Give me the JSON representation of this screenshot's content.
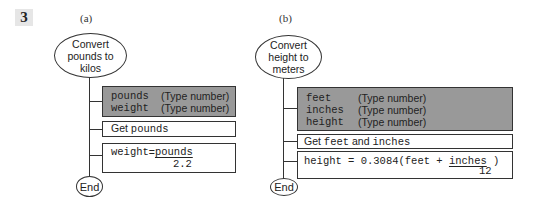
{
  "exercise_number": "3",
  "panel_a": {
    "label": "(a)",
    "start": {
      "line1": "Convert",
      "line2": "pounds to",
      "line3": "kilos"
    },
    "declare": [
      {
        "name": "pounds",
        "type": "(Type number)"
      },
      {
        "name": "weight",
        "type": "(Type number)"
      }
    ],
    "get": {
      "prefix": "Get ",
      "var": "pounds"
    },
    "assign": {
      "lhs": "weight",
      "eq": " = ",
      "numerator": "pounds",
      "denominator": "2.2"
    },
    "end": "End"
  },
  "panel_b": {
    "label": "(b)",
    "start": {
      "line1": "Convert",
      "line2": "height to",
      "line3": "meters"
    },
    "declare": [
      {
        "name": "feet",
        "type": "(Type number)"
      },
      {
        "name": "inches",
        "type": "(Type number)"
      },
      {
        "name": "height",
        "type": "(Type number)"
      }
    ],
    "get": {
      "prefix": "Get ",
      "var1": "feet",
      "mid": " and ",
      "var2": "inches"
    },
    "assign": {
      "expr": "height = 0.3084(feet + ",
      "numerator": "inches",
      "close": " )",
      "denominator": "12"
    },
    "end": "End"
  }
}
